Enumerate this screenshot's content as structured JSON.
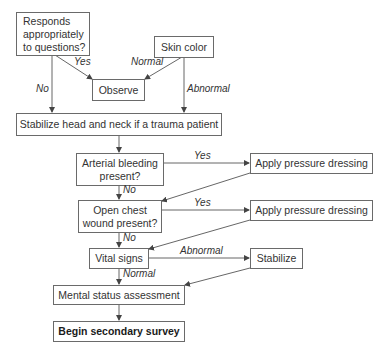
{
  "nodes": {
    "responds": "Responds appropriately to questions?",
    "skin_color": "Skin color",
    "observe": "Observe",
    "stabilize_head": "Stabilize head and neck if a trauma patient",
    "arterial": "Arterial bleeding present?",
    "apply1": "Apply pressure dressing",
    "open_chest": "Open chest wound present?",
    "apply2": "Apply pressure dressing",
    "vital_signs": "Vital signs",
    "stabilize": "Stabilize",
    "mental_status": "Mental status assessment",
    "secondary_survey": "Begin secondary survey"
  },
  "edges": {
    "responds_yes": "Yes",
    "responds_no": "No",
    "skin_normal": "Normal",
    "skin_abnormal": "Abnormal",
    "arterial_yes": "Yes",
    "arterial_no": "No",
    "chest_yes": "Yes",
    "chest_no": "No",
    "vital_abnormal": "Abnormal",
    "vital_normal": "Normal"
  }
}
